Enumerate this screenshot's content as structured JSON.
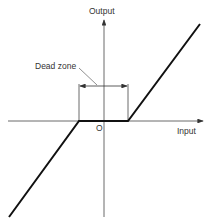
{
  "diagram": {
    "y_axis_label": "Output",
    "x_axis_label": "Input",
    "origin_label": "O",
    "annotation": "Dead zone",
    "colors": {
      "line": "#111111",
      "axis": "#444444",
      "text": "#333333"
    }
  }
}
